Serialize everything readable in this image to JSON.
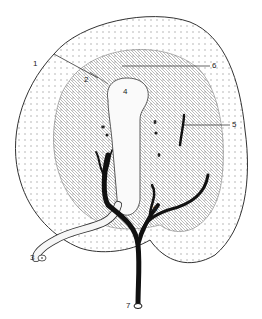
{
  "diagram": {
    "type": "anatomical-illustration",
    "colors": {
      "line": "#333333",
      "vessel": "#111111",
      "background": "#ffffff",
      "stipple": "#777777"
    },
    "labels": [
      {
        "id": "1",
        "text": "1",
        "x": 33,
        "y": 64
      },
      {
        "id": "2",
        "text": "2",
        "x": 84,
        "y": 80
      },
      {
        "id": "3",
        "text": "3",
        "x": 31,
        "y": 258
      },
      {
        "id": "4",
        "text": "4",
        "x": 123,
        "y": 92
      },
      {
        "id": "5",
        "text": "5",
        "x": 232,
        "y": 123
      },
      {
        "id": "6",
        "text": "6",
        "x": 212,
        "y": 64
      },
      {
        "id": "7",
        "text": "7",
        "x": 126,
        "y": 306
      },
      {
        "id": "8",
        "text": "8",
        "x": 153,
        "y": 208
      }
    ]
  }
}
